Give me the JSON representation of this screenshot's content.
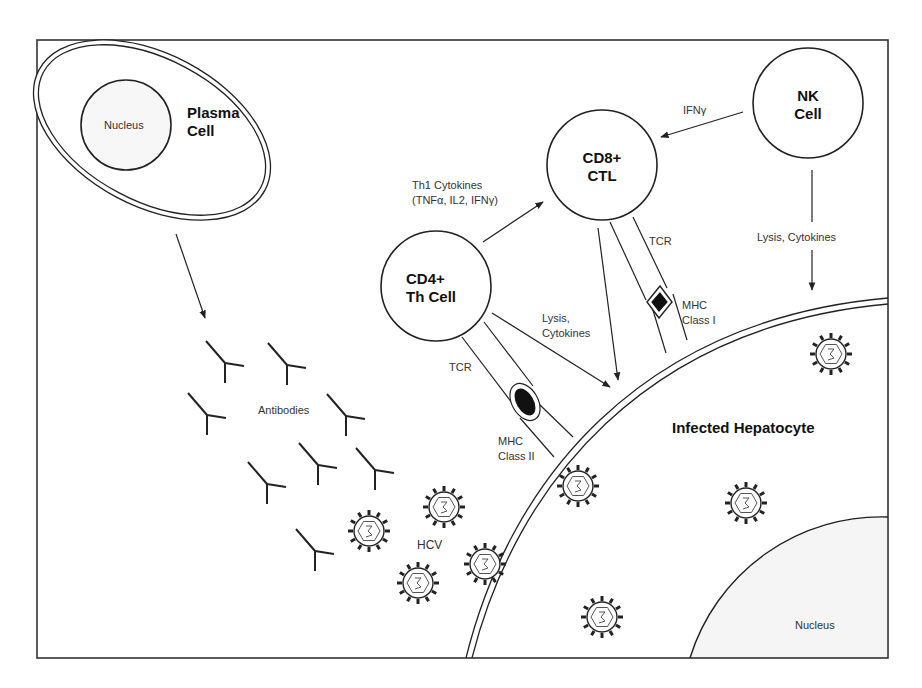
{
  "diagram": {
    "title": "",
    "cells": {
      "plasma_cell": {
        "label_line1": "Plasma",
        "label_line2": "Cell",
        "nucleus_label": "Nucleus"
      },
      "cd8_ctl": {
        "label_line1": "CD8+",
        "label_line2": "CTL"
      },
      "nk_cell": {
        "label_line1": "NK",
        "label_line2": "Cell"
      },
      "cd4_th": {
        "label_line1": "CD4+",
        "label_line2": "Th Cell"
      },
      "hepatocyte": {
        "label": "Infected Hepatocyte",
        "nucleus_label": "Nucleus"
      }
    },
    "labels": {
      "ifn_gamma": "IFNγ",
      "th1_line1": "Th1 Cytokines",
      "th1_line2": "(TNFα, IL2, IFNγ)",
      "nk_lysis": "Lysis, Cytokines",
      "cd4_lysis_line1": "Lysis,",
      "cd4_lysis_line2": "Cytokines",
      "tcr_cd8": "TCR",
      "tcr_cd4": "TCR",
      "mhc1_line1": "MHC",
      "mhc1_line2": "Class I",
      "mhc2_line1": "MHC",
      "mhc2_line2": "Class II",
      "antibodies": "Antibodies",
      "hcv": "HCV"
    },
    "colors": {
      "stroke": "#222222",
      "nucleus_fill": "#f4f4f4",
      "background": "#ffffff"
    }
  }
}
